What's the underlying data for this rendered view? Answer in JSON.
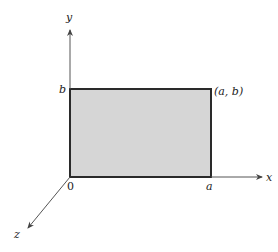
{
  "diagram": {
    "type": "coordinate-axes-with-rectangle",
    "axes": {
      "x_label": "x",
      "y_label": "y",
      "z_label": "z"
    },
    "labels": {
      "origin": "0",
      "a": "a",
      "b": "b",
      "corner": "(a, b)"
    },
    "rectangle": {
      "fill_color": "#d6d6d6",
      "stroke_color": "#2a2a2a",
      "vertices": [
        "(0, 0)",
        "(a, 0)",
        "(a, b)",
        "(0, b)"
      ]
    },
    "colors": {
      "axis": "#555555",
      "text": "#222222"
    }
  }
}
